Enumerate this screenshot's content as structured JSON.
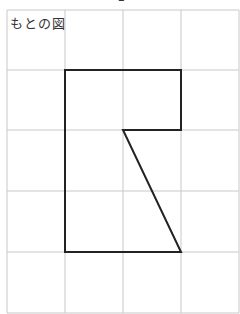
{
  "title": "もとの図",
  "top_fragment": "2",
  "grid": {
    "x_lines": [
      7,
      65,
      123,
      181,
      239
    ],
    "y_lines": [
      10,
      70,
      130,
      191,
      252,
      313
    ],
    "line_color": "#c8c8c8"
  },
  "shape": {
    "points": "65,70 181,70 181,130 123,130 181,252 65,252",
    "stroke": "#222222",
    "stroke_width": 2
  }
}
